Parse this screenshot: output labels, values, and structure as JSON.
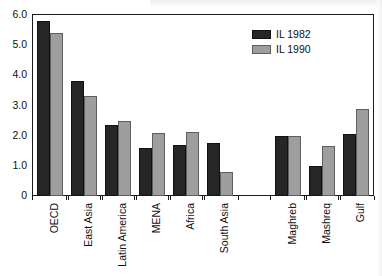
{
  "chart_data": {
    "type": "bar",
    "title": "",
    "xlabel": "",
    "ylabel": "",
    "ylim": [
      0,
      6.0
    ],
    "ytick_labels": [
      "0",
      "1.0",
      "2.0",
      "3.0",
      "4.0",
      "5.0",
      "6.0"
    ],
    "ytick_values": [
      0,
      1.0,
      2.0,
      3.0,
      4.0,
      5.0,
      6.0
    ],
    "grid": false,
    "legend_position": "top-right",
    "categories": [
      "OECD",
      "East Asia",
      "Latin America",
      "MENA",
      "Africa",
      "South Asia",
      "Maghreb",
      "Mashreq",
      "Gulf"
    ],
    "series": [
      {
        "name": "IL 1982",
        "color": "#262626",
        "values": [
          5.8,
          3.8,
          2.35,
          1.6,
          1.68,
          1.75,
          2.0,
          1.0,
          2.05
        ]
      },
      {
        "name": "IL 1990",
        "color": "#9e9e9e",
        "values": [
          5.4,
          3.3,
          2.5,
          2.1,
          2.13,
          0.78,
          2.0,
          1.67,
          2.9
        ]
      }
    ],
    "group_gap_after_index": 5,
    "annotations": []
  },
  "legend": {
    "items": [
      {
        "label": "IL 1982",
        "series_index": 0
      },
      {
        "label": "IL 1990",
        "series_index": 1
      }
    ]
  }
}
